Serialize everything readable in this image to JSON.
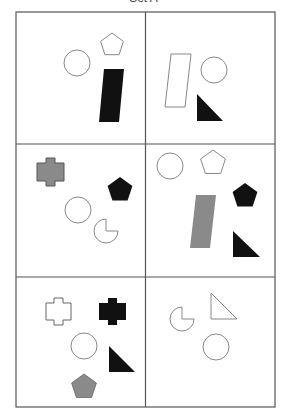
{
  "header": {
    "text": "Set A"
  },
  "colors": {
    "black": "#111111",
    "grey": "#8a8a8a",
    "outline": "#888888",
    "grid": "#555555"
  },
  "grid": {
    "rows": 3,
    "cols": 2
  },
  "cells": [
    {
      "label": "cell-1",
      "shapes": [
        "white circle",
        "white pentagon",
        "black parallelogram"
      ]
    },
    {
      "label": "cell-2",
      "shapes": [
        "white parallelogram",
        "white circle",
        "black right triangle"
      ]
    },
    {
      "label": "cell-3",
      "shapes": [
        "grey cross",
        "black pentagon",
        "white circle",
        "white pacman"
      ]
    },
    {
      "label": "cell-4",
      "shapes": [
        "white circle",
        "white pentagon",
        "black pentagon",
        "grey parallelogram",
        "black right triangle"
      ]
    },
    {
      "label": "cell-5",
      "shapes": [
        "white cross",
        "black cross",
        "white circle",
        "black right triangle",
        "grey pentagon"
      ]
    },
    {
      "label": "cell-6",
      "shapes": [
        "white pacman",
        "white right triangle",
        "white circle"
      ]
    }
  ]
}
